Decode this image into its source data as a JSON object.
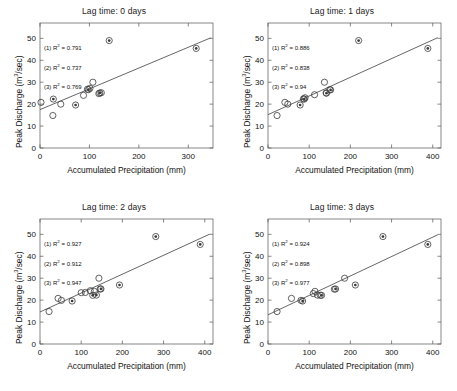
{
  "figure": {
    "background": "#ffffff",
    "axis_color": "#555555",
    "marker_color": "#3a3a3a",
    "fit_line_color": "#333333"
  },
  "common": {
    "xlabel": "Accumulated Precipitation (mm)",
    "ylabel_pre": "Peak Discharge (m",
    "ylabel_sup": "3",
    "ylabel_post": "/sec)",
    "r2_symbol": "R",
    "r2_sup": "2",
    "eq": " = "
  },
  "chart_data": [
    {
      "id": "panel-lag-0",
      "type": "scatter",
      "title": "Lag time: 0 days",
      "xlabel": "Accumulated Precipitation (mm)",
      "ylabel": "Peak Discharge (m3/sec)",
      "xlim": [
        0,
        350
      ],
      "ylim": [
        0,
        57
      ],
      "xticks": [
        0,
        100,
        200,
        300
      ],
      "yticks": [
        0,
        10,
        20,
        30,
        40,
        50
      ],
      "grid": false,
      "annotations": [
        {
          "key": "(1) R",
          "sup": "2",
          "value": "0.791",
          "text": "(1) R2 = 0.791"
        },
        {
          "key": "(2) R",
          "sup": "2",
          "value": "0.737",
          "text": "(2) R2 = 0.737"
        },
        {
          "key": "(3) R",
          "sup": "2",
          "value": "0.769",
          "text": "(3) R2 = 0.769"
        }
      ],
      "series": [
        {
          "name": "open-circle",
          "marker": "open",
          "points": [
            {
              "x": 2,
              "y": 20.8
            },
            {
              "x": 26,
              "y": 14.8
            },
            {
              "x": 42,
              "y": 20.0
            },
            {
              "x": 88,
              "y": 24.0
            },
            {
              "x": 96,
              "y": 26.8
            },
            {
              "x": 101,
              "y": 27.2
            },
            {
              "x": 107,
              "y": 30.0
            },
            {
              "x": 119,
              "y": 24.8
            },
            {
              "x": 124,
              "y": 25.2
            }
          ]
        },
        {
          "name": "filled-circle",
          "marker": "filled",
          "points": [
            {
              "x": 27,
              "y": 22.3
            },
            {
              "x": 72,
              "y": 19.6
            },
            {
              "x": 98,
              "y": 26.6
            },
            {
              "x": 121,
              "y": 25.1
            },
            {
              "x": 140,
              "y": 49.0
            },
            {
              "x": 316,
              "y": 45.4
            }
          ]
        }
      ],
      "fit_line": {
        "x0": 0,
        "y0": 17.5,
        "x1": 345,
        "y1": 50.2
      }
    },
    {
      "id": "panel-lag-1",
      "type": "scatter",
      "title": "Lag time: 1 days",
      "xlabel": "Accumulated Precipitation (mm)",
      "ylabel": "Peak Discharge (m3/sec)",
      "xlim": [
        0,
        420
      ],
      "ylim": [
        0,
        57
      ],
      "xticks": [
        0,
        100,
        200,
        300,
        400
      ],
      "yticks": [
        0,
        10,
        20,
        30,
        40,
        50
      ],
      "grid": false,
      "annotations": [
        {
          "key": "(1) R",
          "sup": "2",
          "value": "0.886",
          "text": "(1) R2 = 0.886"
        },
        {
          "key": "(2) R",
          "sup": "2",
          "value": "0.838",
          "text": "(2) R2 = 0.838"
        },
        {
          "key": "(3) R",
          "sup": "2",
          "value": "0.94",
          "text": "(3) R2 = 0.94"
        }
      ],
      "series": [
        {
          "name": "open-circle",
          "marker": "open",
          "points": [
            {
              "x": 22,
              "y": 14.8
            },
            {
              "x": 41,
              "y": 20.8
            },
            {
              "x": 48,
              "y": 20.0
            },
            {
              "x": 86,
              "y": 22.4
            },
            {
              "x": 90,
              "y": 22.9
            },
            {
              "x": 113,
              "y": 24.3
            },
            {
              "x": 137,
              "y": 30.0
            },
            {
              "x": 141,
              "y": 25.1
            },
            {
              "x": 150,
              "y": 26.6
            }
          ]
        },
        {
          "name": "filled-circle",
          "marker": "filled",
          "points": [
            {
              "x": 78,
              "y": 19.6
            },
            {
              "x": 88,
              "y": 22.3
            },
            {
              "x": 142,
              "y": 25.0
            },
            {
              "x": 152,
              "y": 26.5
            },
            {
              "x": 220,
              "y": 49.0
            },
            {
              "x": 388,
              "y": 45.4
            }
          ]
        }
      ],
      "fit_line": {
        "x0": 0,
        "y0": 15.2,
        "x1": 412,
        "y1": 50.3
      }
    },
    {
      "id": "panel-lag-2",
      "type": "scatter",
      "title": "Lag time: 2 days",
      "xlabel": "Accumulated Precipitation (mm)",
      "ylabel": "Peak Discharge (m3/sec)",
      "xlim": [
        0,
        420
      ],
      "ylim": [
        0,
        57
      ],
      "xticks": [
        0,
        100,
        200,
        300,
        400
      ],
      "yticks": [
        0,
        10,
        20,
        30,
        40,
        50
      ],
      "grid": false,
      "annotations": [
        {
          "key": "(1) R",
          "sup": "2",
          "value": "0.927",
          "text": "(1) R2 = 0.927"
        },
        {
          "key": "(2) R",
          "sup": "2",
          "value": "0.912",
          "text": "(2) R2 = 0.912"
        },
        {
          "key": "(3) R",
          "sup": "2",
          "value": "0.947",
          "text": "(3) R2 = 0.947"
        }
      ],
      "series": [
        {
          "name": "open-circle",
          "marker": "open",
          "points": [
            {
              "x": 22,
              "y": 14.8
            },
            {
              "x": 44,
              "y": 20.8
            },
            {
              "x": 52,
              "y": 19.9
            },
            {
              "x": 100,
              "y": 23.4
            },
            {
              "x": 110,
              "y": 23.5
            },
            {
              "x": 122,
              "y": 24.3
            },
            {
              "x": 132,
              "y": 24.0
            },
            {
              "x": 143,
              "y": 30.0
            },
            {
              "x": 146,
              "y": 25.1
            }
          ]
        },
        {
          "name": "filled-circle",
          "marker": "filled",
          "points": [
            {
              "x": 78,
              "y": 19.6
            },
            {
              "x": 128,
              "y": 22.2
            },
            {
              "x": 137,
              "y": 22.3
            },
            {
              "x": 148,
              "y": 25.1
            },
            {
              "x": 193,
              "y": 26.9
            },
            {
              "x": 281,
              "y": 49.0
            },
            {
              "x": 389,
              "y": 45.4
            }
          ]
        }
      ],
      "fit_line": {
        "x0": 0,
        "y0": 14.6,
        "x1": 412,
        "y1": 50.1
      }
    },
    {
      "id": "panel-lag-3",
      "type": "scatter",
      "title": "Lag time: 3 days",
      "xlabel": "Accumulated Precipitation (mm)",
      "ylabel": "Peak Discharge (m3/sec)",
      "xlim": [
        0,
        420
      ],
      "ylim": [
        0,
        57
      ],
      "xticks": [
        0,
        100,
        200,
        300,
        400
      ],
      "yticks": [
        0,
        10,
        20,
        30,
        40,
        50
      ],
      "grid": false,
      "annotations": [
        {
          "key": "(1) R",
          "sup": "2",
          "value": "0.924",
          "text": "(1) R2 = 0.924"
        },
        {
          "key": "(2) R",
          "sup": "2",
          "value": "0.898",
          "text": "(2) R2 = 0.898"
        },
        {
          "key": "(3) R",
          "sup": "2",
          "value": "0.977",
          "text": "(3) R2 = 0.977"
        }
      ],
      "series": [
        {
          "name": "open-circle",
          "marker": "open",
          "points": [
            {
              "x": 22,
              "y": 14.8
            },
            {
              "x": 57,
              "y": 20.8
            },
            {
              "x": 80,
              "y": 19.9
            },
            {
              "x": 110,
              "y": 23.0
            },
            {
              "x": 114,
              "y": 24.0
            },
            {
              "x": 120,
              "y": 22.3
            },
            {
              "x": 127,
              "y": 22.2
            },
            {
              "x": 161,
              "y": 25.0
            },
            {
              "x": 186,
              "y": 30.0
            }
          ]
        },
        {
          "name": "filled-circle",
          "marker": "filled",
          "points": [
            {
              "x": 84,
              "y": 19.6
            },
            {
              "x": 130,
              "y": 22.2
            },
            {
              "x": 164,
              "y": 25.1
            },
            {
              "x": 212,
              "y": 26.9
            },
            {
              "x": 279,
              "y": 49.0
            },
            {
              "x": 388,
              "y": 45.4
            }
          ]
        }
      ],
      "fit_line": {
        "x0": 0,
        "y0": 13.3,
        "x1": 412,
        "y1": 49.8
      }
    }
  ]
}
